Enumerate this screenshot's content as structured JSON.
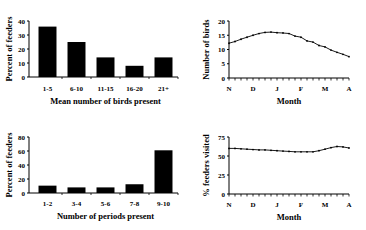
{
  "chart_data": [
    {
      "type": "bar",
      "position": "top-left",
      "categories": [
        "1-5",
        "6-10",
        "11-15",
        "16-20",
        "21+"
      ],
      "values": [
        36,
        25,
        14,
        8,
        14
      ],
      "xlabel": "Mean number of birds present",
      "ylabel": "Percent of feeders",
      "ylim": [
        0,
        40
      ],
      "yticks": [
        0,
        10,
        20,
        30,
        40
      ],
      "grid": false,
      "bar_color": "#000000"
    },
    {
      "type": "line",
      "position": "top-right",
      "xlabel": "Month",
      "ylabel": "Number of birds",
      "ylim": [
        0,
        20
      ],
      "yticks": [
        0,
        5,
        10,
        15,
        20
      ],
      "xticks": [
        "N",
        "D",
        "J",
        "F",
        "M",
        "A"
      ],
      "grid": false,
      "series": [
        {
          "name": "Number of birds",
          "values": [
            12.2,
            12.8,
            13.6,
            14.3,
            15.0,
            15.6,
            16.0,
            16.1,
            15.9,
            15.8,
            15.6,
            14.7,
            14.3,
            13.0,
            12.6,
            11.4,
            10.9,
            9.8,
            9.0,
            8.3,
            7.5
          ]
        }
      ]
    },
    {
      "type": "bar",
      "position": "bottom-left",
      "categories": [
        "1-2",
        "3-4",
        "5-6",
        "7-8",
        "9-10"
      ],
      "values": [
        10.5,
        8,
        8,
        12.5,
        61
      ],
      "xlabel": "Number of periods present",
      "ylabel": "Percent of feeders",
      "ylim": [
        0,
        80
      ],
      "yticks": [
        0,
        20,
        40,
        60,
        80
      ],
      "grid": false,
      "bar_color": "#000000"
    },
    {
      "type": "line",
      "position": "bottom-right",
      "xlabel": "Month",
      "ylabel": "% feeders visited",
      "ylim": [
        0,
        75
      ],
      "yticks": [
        0,
        25,
        50,
        75
      ],
      "xticks": [
        "N",
        "D",
        "J",
        "F",
        "M",
        "A"
      ],
      "grid": false,
      "series": [
        {
          "name": "% feeders visited",
          "values": [
            60,
            60,
            59.5,
            59,
            58.5,
            58,
            58,
            57.5,
            57,
            56.5,
            56,
            55.5,
            55.5,
            55.5,
            55.5,
            57,
            59,
            61,
            62.5,
            62,
            60.5
          ]
        }
      ]
    }
  ]
}
